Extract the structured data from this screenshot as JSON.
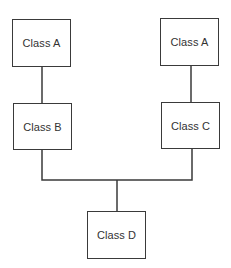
{
  "diagram": {
    "type": "class-hierarchy",
    "nodes": [
      {
        "id": "a_left",
        "label": "Class A"
      },
      {
        "id": "a_right",
        "label": "Class A"
      },
      {
        "id": "b",
        "label": "Class B"
      },
      {
        "id": "c",
        "label": "Class C"
      },
      {
        "id": "d",
        "label": "Class D"
      }
    ],
    "edges": [
      {
        "from": "a_left",
        "to": "b"
      },
      {
        "from": "a_right",
        "to": "c"
      },
      {
        "from": "b",
        "to": "d"
      },
      {
        "from": "c",
        "to": "d"
      }
    ],
    "colors": {
      "line": "#3a3a3a",
      "text": "#333333",
      "background": "#ffffff"
    }
  }
}
